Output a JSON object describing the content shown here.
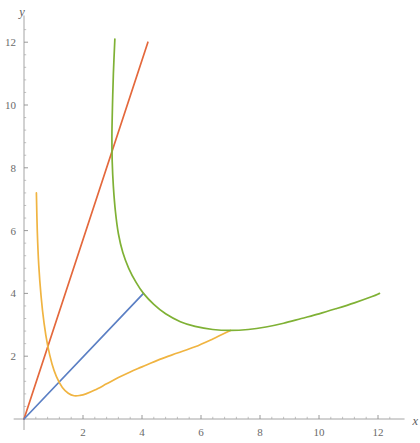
{
  "chart_data": {
    "type": "line",
    "title": "",
    "xlabel": "x",
    "ylabel": "y",
    "xlim": [
      -0.35,
      12.9
    ],
    "ylim": [
      -0.35,
      12.85
    ],
    "grid": false,
    "legend": "none",
    "x_ticks_major": [
      2,
      4,
      6,
      8,
      10,
      12
    ],
    "x_tick_labels": [
      "2",
      "4",
      "6",
      "8",
      "10",
      "12"
    ],
    "y_ticks_major": [
      2,
      4,
      6,
      8,
      10,
      12
    ],
    "y_tick_labels": [
      "2",
      "4",
      "6",
      "8",
      "10",
      "12"
    ],
    "x_ticks_minor": [
      0.4,
      0.8,
      1.2,
      1.6,
      2.4,
      2.8,
      3.2,
      3.6,
      4.4,
      4.8,
      5.2,
      5.6,
      6.4,
      6.8,
      7.2,
      7.6,
      8.4,
      8.8,
      9.2,
      9.6,
      10.4,
      10.8,
      11.2,
      11.6,
      12.4
    ],
    "y_ticks_minor": [
      0.4,
      0.8,
      1.2,
      1.6,
      2.4,
      2.8,
      3.2,
      3.6,
      4.4,
      4.8,
      5.2,
      5.6,
      6.4,
      6.8,
      7.2,
      7.6,
      8.4,
      8.8,
      9.2,
      9.6,
      10.4,
      10.8,
      11.2,
      11.6,
      12.4
    ],
    "series": [
      {
        "name": "red-line",
        "color": "#e4683c",
        "type": "line",
        "points": [
          [
            0,
            0
          ],
          [
            4.2,
            12.0
          ]
        ]
      },
      {
        "name": "blue-line",
        "color": "#5b7fc4",
        "type": "line",
        "points": [
          [
            0,
            0
          ],
          [
            4.05,
            4.0
          ]
        ]
      },
      {
        "name": "orange-curve",
        "color": "#f0b441",
        "type": "curve",
        "points": [
          [
            0.42,
            7.2
          ],
          [
            0.45,
            6.0
          ],
          [
            0.5,
            4.9
          ],
          [
            0.58,
            3.9
          ],
          [
            0.68,
            3.05
          ],
          [
            0.8,
            2.35
          ],
          [
            0.95,
            1.75
          ],
          [
            1.1,
            1.35
          ],
          [
            1.3,
            1.0
          ],
          [
            1.5,
            0.82
          ],
          [
            1.7,
            0.74
          ],
          [
            1.9,
            0.75
          ],
          [
            2.1,
            0.8
          ],
          [
            2.4,
            0.92
          ],
          [
            2.8,
            1.12
          ],
          [
            3.2,
            1.32
          ],
          [
            3.6,
            1.5
          ],
          [
            4.0,
            1.66
          ],
          [
            4.6,
            1.9
          ],
          [
            5.2,
            2.1
          ],
          [
            5.8,
            2.3
          ],
          [
            6.4,
            2.55
          ],
          [
            7.0,
            2.82
          ]
        ]
      },
      {
        "name": "green-curve",
        "color": "#7fb135",
        "type": "curve",
        "points": [
          [
            3.08,
            12.1
          ],
          [
            3.03,
            11.0
          ],
          [
            3.0,
            10.0
          ],
          [
            2.98,
            9.0
          ],
          [
            2.99,
            8.2
          ],
          [
            3.03,
            7.4
          ],
          [
            3.1,
            6.6
          ],
          [
            3.2,
            5.9
          ],
          [
            3.35,
            5.3
          ],
          [
            3.55,
            4.8
          ],
          [
            3.8,
            4.35
          ],
          [
            4.05,
            4.0
          ],
          [
            4.4,
            3.65
          ],
          [
            4.8,
            3.35
          ],
          [
            5.3,
            3.1
          ],
          [
            5.8,
            2.95
          ],
          [
            6.4,
            2.85
          ],
          [
            7.0,
            2.82
          ],
          [
            7.6,
            2.85
          ],
          [
            8.2,
            2.93
          ],
          [
            8.8,
            3.05
          ],
          [
            9.4,
            3.2
          ],
          [
            10.0,
            3.35
          ],
          [
            10.6,
            3.52
          ],
          [
            11.2,
            3.7
          ],
          [
            11.8,
            3.9
          ],
          [
            12.05,
            4.0
          ]
        ]
      }
    ]
  },
  "geometry": {
    "origin_x_px": 24,
    "origin_y_px": 419,
    "scale_x_px_per_unit": 29.5,
    "scale_y_px_per_unit": 31.4,
    "axis_x_start": -0.35,
    "axis_x_end": 12.9,
    "axis_y_start": -0.35,
    "axis_y_end": 12.85
  }
}
